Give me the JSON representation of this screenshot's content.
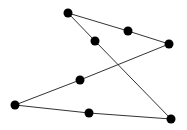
{
  "diagram": {
    "type": "node-graph",
    "background": "#ffffff",
    "node_color": "#000000",
    "edge_color": "#333333",
    "nodes": [
      {
        "id": "n1",
        "x": 68,
        "y": 13
      },
      {
        "id": "n2",
        "x": 128,
        "y": 31
      },
      {
        "id": "n3",
        "x": 169,
        "y": 44
      },
      {
        "id": "n4",
        "x": 95,
        "y": 41
      },
      {
        "id": "n5",
        "x": 80,
        "y": 80
      },
      {
        "id": "n6",
        "x": 15,
        "y": 105
      },
      {
        "id": "n7",
        "x": 89,
        "y": 113
      },
      {
        "id": "n8",
        "x": 171,
        "y": 119
      }
    ],
    "edges": [
      [
        "n1",
        "n2"
      ],
      [
        "n2",
        "n3"
      ],
      [
        "n3",
        "n5"
      ],
      [
        "n5",
        "n6"
      ],
      [
        "n6",
        "n7"
      ],
      [
        "n7",
        "n8"
      ],
      [
        "n8",
        "n4"
      ],
      [
        "n4",
        "n1"
      ]
    ]
  }
}
